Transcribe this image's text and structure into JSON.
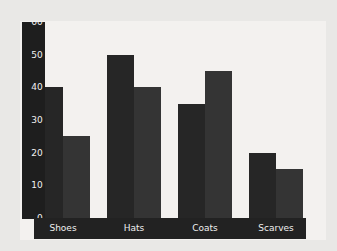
{
  "chart_data": {
    "type": "bar",
    "title": "",
    "subtitle": "",
    "xlabel": "",
    "ylabel": "",
    "categories": [
      "Shoes",
      "Hats",
      "Coats",
      "Scarves"
    ],
    "series": [
      {
        "name": "Series 1",
        "values": [
          40,
          50,
          35,
          20
        ],
        "color": "#262626"
      },
      {
        "name": "Series 2",
        "values": [
          25,
          40,
          45,
          15
        ],
        "color": "#343434"
      }
    ],
    "ylim": [
      0,
      60
    ],
    "y_ticks": [
      0,
      10,
      20,
      30,
      40,
      50,
      60
    ],
    "y_tick_labels": [
      "0",
      "10",
      "20",
      "30",
      "40",
      "50",
      "60"
    ],
    "grid": false,
    "legend": "none",
    "axis_style": {
      "y_axis_band_color": "#1e1e1e",
      "x_axis_band_color": "#222222",
      "tick_label_color": "#f0f0f0",
      "plot_background": "#f3f1ef",
      "figure_background": "#e9e8e6"
    }
  }
}
